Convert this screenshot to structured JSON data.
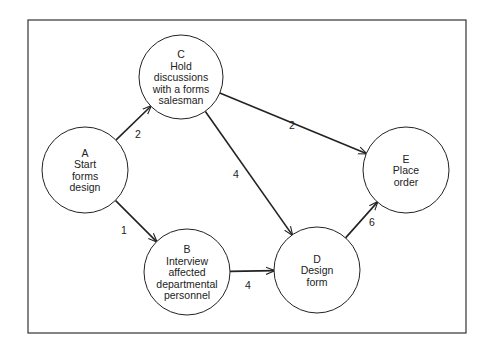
{
  "diagram": {
    "type": "pert-network",
    "frame": {
      "x": 28,
      "y": 20,
      "width": 438,
      "height": 313
    },
    "nodes": [
      {
        "id": "A",
        "letter": "A",
        "lines": [
          "Start",
          "forms",
          "design"
        ],
        "cx": 85,
        "cy": 170,
        "r": 43
      },
      {
        "id": "B",
        "letter": "B",
        "lines": [
          "Interview",
          "affected",
          "departmental",
          "personnel"
        ],
        "cx": 187,
        "cy": 272,
        "r": 43
      },
      {
        "id": "C",
        "letter": "C",
        "lines": [
          "Hold",
          "discussions",
          "with a forms",
          "salesman"
        ],
        "cx": 181,
        "cy": 77,
        "r": 42
      },
      {
        "id": "D",
        "letter": "D",
        "lines": [
          "Design",
          "form"
        ],
        "cx": 317,
        "cy": 270,
        "r": 43
      },
      {
        "id": "E",
        "letter": "E",
        "lines": [
          "Place",
          "order"
        ],
        "cx": 406,
        "cy": 170,
        "r": 43
      }
    ],
    "edges": [
      {
        "from": "A",
        "to": "C",
        "label": "2",
        "lx": 138,
        "ly": 138
      },
      {
        "from": "A",
        "to": "B",
        "label": "1",
        "lx": 124,
        "ly": 234
      },
      {
        "from": "C",
        "to": "E",
        "label": "2",
        "lx": 292,
        "ly": 129
      },
      {
        "from": "C",
        "to": "D",
        "label": "4",
        "lx": 236,
        "ly": 178
      },
      {
        "from": "B",
        "to": "D",
        "label": "4",
        "lx": 248,
        "ly": 289
      },
      {
        "from": "D",
        "to": "E",
        "label": "6",
        "lx": 372,
        "ly": 226
      }
    ],
    "colors": {
      "line": "#222222",
      "background": "#ffffff"
    }
  }
}
